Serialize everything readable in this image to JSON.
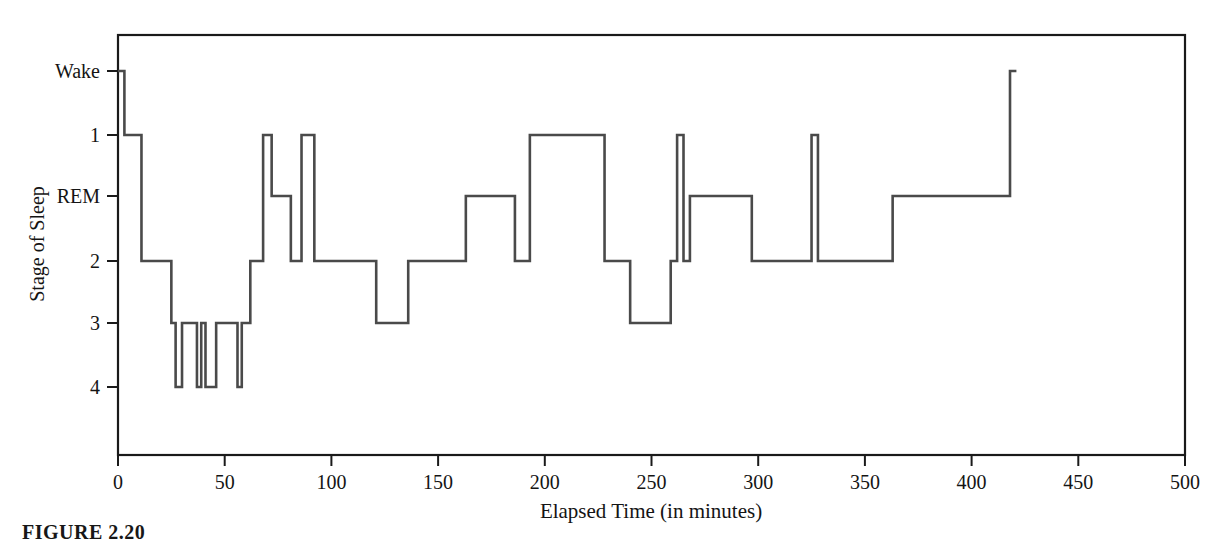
{
  "figure": {
    "caption": "FIGURE 2.20",
    "background_color": "#ffffff",
    "line_color": "#4a4a4a",
    "axis_color": "#1a1a1a"
  },
  "chart_data": {
    "type": "line",
    "subtype": "step-hypnogram",
    "title": "",
    "subtitle": "",
    "xlabel": "Elapsed Time (in minutes)",
    "ylabel": "Stage of Sleep",
    "grid": false,
    "legend": "none",
    "xlim": [
      0,
      500
    ],
    "xticks": [
      0,
      50,
      100,
      150,
      200,
      250,
      300,
      350,
      400,
      450,
      500
    ],
    "xticklabels": [
      "0",
      "50",
      "100",
      "150",
      "200",
      "250",
      "300",
      "350",
      "400",
      "450",
      "500"
    ],
    "yticks": [
      0,
      1,
      2,
      3,
      4,
      5
    ],
    "yticklabels": [
      "Wake",
      "1",
      "REM",
      "2",
      "3",
      "4"
    ],
    "ylim_levels": [
      0,
      5
    ],
    "y_level_map": {
      "Wake": 0,
      "1": 1,
      "REM": 2,
      "2": 3,
      "3": 4,
      "4": 5
    },
    "y_inverted": true,
    "series": [
      {
        "name": "Stage of Sleep",
        "step": "post",
        "x": [
          0,
          3,
          3,
          8,
          8,
          11,
          11,
          22,
          22,
          25,
          25,
          27,
          27,
          30,
          30,
          37,
          37,
          39,
          39,
          41,
          41,
          46,
          46,
          48,
          48,
          56,
          56,
          58,
          58,
          62,
          62,
          68,
          68,
          72,
          72,
          78,
          78,
          81,
          81,
          86,
          86,
          92,
          92,
          121,
          121,
          136,
          136,
          163,
          163,
          168,
          168,
          174,
          174,
          186,
          186,
          193,
          193,
          228,
          228,
          240,
          240,
          259,
          259,
          262,
          262,
          265,
          265,
          268,
          268,
          275,
          275,
          281,
          281,
          297,
          297,
          325,
          325,
          328,
          328,
          363,
          363,
          369,
          369,
          415,
          415,
          418,
          418,
          421
        ],
        "y_levels": [
          0,
          0,
          1,
          1,
          1,
          1,
          3,
          3,
          3,
          3,
          4,
          4,
          5,
          5,
          4,
          4,
          5,
          5,
          4,
          4,
          5,
          5,
          4,
          4,
          4,
          4,
          5,
          5,
          4,
          4,
          3,
          3,
          1,
          1,
          2,
          2,
          2,
          2,
          3,
          3,
          1,
          1,
          3,
          3,
          4,
          4,
          3,
          3,
          2,
          2,
          2,
          2,
          2,
          2,
          3,
          3,
          1,
          1,
          3,
          3,
          4,
          4,
          3,
          3,
          1,
          1,
          3,
          3,
          2,
          2,
          2,
          2,
          2,
          2,
          3,
          3,
          1,
          1,
          3,
          3,
          2,
          2,
          2,
          2,
          2,
          2,
          0,
          0
        ],
        "y_stage_labels": [
          "Wake",
          "Wake",
          "1",
          "1",
          "1",
          "1",
          "2",
          "2",
          "2",
          "2",
          "3",
          "3",
          "4",
          "4",
          "3",
          "3",
          "4",
          "4",
          "3",
          "3",
          "4",
          "4",
          "3",
          "3",
          "3",
          "3",
          "4",
          "4",
          "3",
          "3",
          "2",
          "2",
          "1",
          "1",
          "REM",
          "REM",
          "REM",
          "REM",
          "2",
          "2",
          "1",
          "1",
          "2",
          "2",
          "3",
          "3",
          "2",
          "2",
          "REM",
          "REM",
          "REM",
          "REM",
          "REM",
          "REM",
          "2",
          "2",
          "1",
          "1",
          "2",
          "2",
          "3",
          "3",
          "2",
          "2",
          "1",
          "1",
          "2",
          "2",
          "REM",
          "REM",
          "REM",
          "REM",
          "REM",
          "REM",
          "2",
          "2",
          "1",
          "1",
          "2",
          "2",
          "REM",
          "REM",
          "REM",
          "REM",
          "REM",
          "REM",
          "Wake",
          "Wake"
        ]
      }
    ],
    "annotations": []
  }
}
